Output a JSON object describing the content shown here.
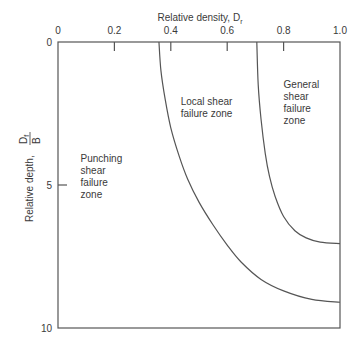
{
  "chart_data": {
    "type": "line",
    "title": "",
    "xlabel": "Relative density, D_r",
    "xlabel_main": "Relative density, D",
    "xlabel_sub": "r",
    "ylabel": "Relative depth, Df/B",
    "ylabel_main": "Relative depth, ",
    "ylabel_num": "D",
    "ylabel_num_sub": "f",
    "ylabel_den": "B",
    "x_axis_position": "top",
    "y_axis_inverted": true,
    "xlim": [
      0,
      1.0
    ],
    "ylim": [
      0,
      10
    ],
    "grid": false,
    "x_ticks": [
      "0",
      "0.2",
      "0.4",
      "0.6",
      "0.8",
      "1.0"
    ],
    "x_tick_values": [
      0,
      0.2,
      0.4,
      0.6,
      0.8,
      1.0
    ],
    "y_ticks": [
      "0",
      "5",
      "10"
    ],
    "y_tick_values": [
      0,
      5,
      10
    ],
    "series": [
      {
        "name": "Punching / local shear boundary",
        "x": [
          0.358,
          0.365,
          0.38,
          0.4,
          0.43,
          0.46,
          0.5,
          0.55,
          0.6,
          0.65,
          0.72,
          0.8,
          0.9,
          1.0
        ],
        "y": [
          0.0,
          1.0,
          2.0,
          3.0,
          4.0,
          4.8,
          5.6,
          6.4,
          7.1,
          7.7,
          8.3,
          8.7,
          9.0,
          9.1
        ]
      },
      {
        "name": "Local / general shear boundary",
        "x": [
          0.705,
          0.71,
          0.72,
          0.735,
          0.75,
          0.77,
          0.8,
          0.84,
          0.88,
          0.93,
          1.0
        ],
        "y": [
          0.0,
          1.5,
          2.7,
          3.9,
          4.7,
          5.4,
          6.1,
          6.6,
          6.85,
          7.0,
          7.05
        ]
      }
    ],
    "annotations": [
      {
        "text_lines": [
          "Punching",
          "shear",
          "failure",
          "zone"
        ],
        "x": 0.08,
        "y": 4.2
      },
      {
        "text_lines": [
          "Local shear",
          "failure zone"
        ],
        "x": 0.435,
        "y": 2.2
      },
      {
        "text_lines": [
          "General",
          "shear",
          "failure",
          "zone"
        ],
        "x": 0.8,
        "y": 1.6
      }
    ],
    "legend": null
  }
}
